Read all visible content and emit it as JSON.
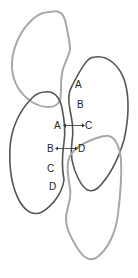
{
  "diagram": {
    "colors": {
      "light_outline": "#a8a8a8",
      "dark_outline": "#555555",
      "text": "#222222",
      "arrow": "#333333",
      "background": "#ffffff"
    },
    "shapes": [
      {
        "id": "top-left-blob",
        "tone": "light"
      },
      {
        "id": "right-blob",
        "tone": "dark"
      },
      {
        "id": "middle-left-blob",
        "tone": "dark"
      },
      {
        "id": "bottom-right-blob",
        "tone": "light"
      }
    ],
    "labels": {
      "a_top": "A",
      "b_top": "B",
      "arrow1_left": "A",
      "arrow1_right": "C",
      "arrow2_left": "B",
      "arrow2_right": "D",
      "c_bottom": "C",
      "d_bottom": "D"
    },
    "arrows": [
      {
        "from": "A",
        "to": "C",
        "direction": "bidirectional"
      },
      {
        "from": "B",
        "to": "D",
        "direction": "bidirectional"
      }
    ]
  }
}
